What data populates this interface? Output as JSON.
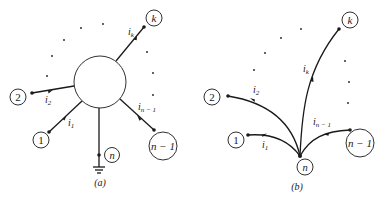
{
  "figure": {
    "panel_a": {
      "caption": "(a)",
      "center_element": "network-circle",
      "nodes": [
        {
          "id": "k",
          "label": "k"
        },
        {
          "id": "2",
          "label": "2"
        },
        {
          "id": "1",
          "label": "1"
        },
        {
          "id": "n-1",
          "label": "n − 1"
        },
        {
          "id": "n",
          "label": "n"
        }
      ],
      "currents": [
        {
          "label": "i",
          "sub": "k"
        },
        {
          "label": "i",
          "sub": "2"
        },
        {
          "label": "i",
          "sub": "1"
        },
        {
          "label": "i",
          "sub": "n − 1"
        }
      ],
      "ground_symbol": "ground-icon"
    },
    "panel_b": {
      "caption": "(b)",
      "nodes": [
        {
          "id": "k",
          "label": "k"
        },
        {
          "id": "2",
          "label": "2"
        },
        {
          "id": "1",
          "label": "1"
        },
        {
          "id": "n-1",
          "label": "n − 1"
        },
        {
          "id": "n",
          "label": "n"
        }
      ],
      "currents": [
        {
          "label": "i",
          "sub": "k"
        },
        {
          "label": "i",
          "sub": "2"
        },
        {
          "label": "i",
          "sub": "1"
        },
        {
          "label": "i",
          "sub": "n − 1"
        }
      ]
    }
  }
}
